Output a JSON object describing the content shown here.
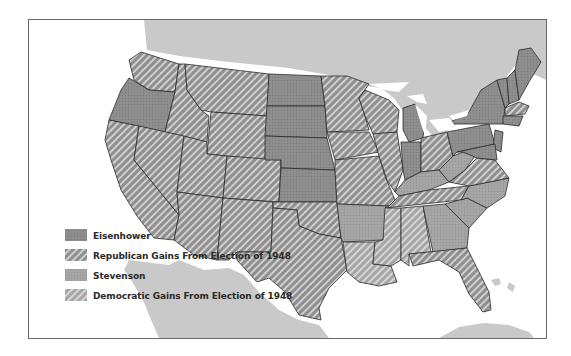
{
  "map": {
    "title": "1952 Presidential Election",
    "region": "United States",
    "colors": {
      "eisenhower": "#8c8c8c",
      "stevenson": "#a2a2a2",
      "land_foreign": "#c8c8c8",
      "water": "#ffffff",
      "hatch_light": "#d4d4d4",
      "border": "#2b2b2b"
    }
  },
  "legend": {
    "items": [
      {
        "label": "Eisenhower",
        "pattern": "solid-dark"
      },
      {
        "label": "Republican Gains From Election of 1948",
        "pattern": "hatch-dark"
      },
      {
        "label": "Stevenson",
        "pattern": "solid-light"
      },
      {
        "label": "Democratic Gains From Election of 1948",
        "pattern": "hatch-light"
      }
    ]
  }
}
